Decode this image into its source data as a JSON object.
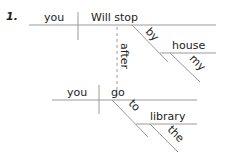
{
  "diagram": {
    "number": "1.",
    "clause1": {
      "subject": "you",
      "verb": "Will stop",
      "modifier_prep": "by",
      "prep_object": "house",
      "prep_object_modifier": "my"
    },
    "connector": "after",
    "clause2": {
      "subject": "you",
      "verb": "go",
      "modifier_prep": "to",
      "prep_object": "library",
      "prep_object_modifier": "the"
    },
    "colors": {
      "line": "#9a9a9a",
      "text": "#222222"
    }
  }
}
